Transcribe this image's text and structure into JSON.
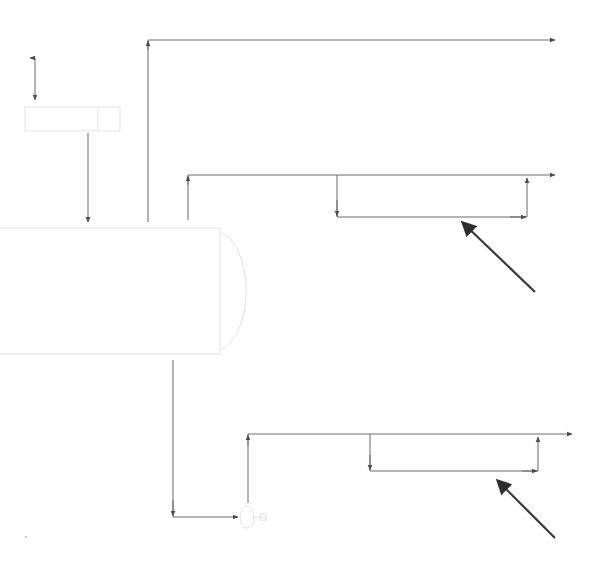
{
  "diagram": {
    "type": "process-flow-diagram",
    "colors": {
      "background": "#ffffff",
      "equipment_outline": "#e2e2e2",
      "stream_line": "#6a6a6a",
      "pointer_arrow": "#3a3a3a"
    },
    "equipment": [
      {
        "id": "exchanger",
        "kind": "heat-exchanger",
        "x": 25,
        "y": 107,
        "w": 95,
        "h": 24,
        "divider_x": 98
      },
      {
        "id": "vessel",
        "kind": "horizontal-drum",
        "x": 0,
        "y": 228,
        "w": 220,
        "h": 126,
        "head_tip_x": 250
      },
      {
        "id": "pump",
        "kind": "pump",
        "cx": 247,
        "cy": 517,
        "rx": 7,
        "ry": 11
      }
    ],
    "streams": [
      {
        "id": "feed-inlet",
        "points": [
          [
            30,
            58
          ],
          [
            35,
            58
          ],
          [
            35,
            100
          ]
        ],
        "arrow": "down"
      },
      {
        "id": "exchanger-to-vessel",
        "points": [
          [
            88,
            133
          ],
          [
            88,
            222
          ]
        ],
        "arrow": "down"
      },
      {
        "id": "overhead-vapor",
        "points": [
          [
            148,
            222
          ],
          [
            148,
            40
          ],
          [
            555,
            40
          ]
        ],
        "arrow": "right"
      },
      {
        "id": "side-draw-upper",
        "points": [
          [
            188,
            220
          ],
          [
            188,
            175
          ],
          [
            555,
            175
          ]
        ],
        "arrow": "right"
      },
      {
        "id": "upper-recycle-loop",
        "points": [
          [
            337,
            175
          ],
          [
            337,
            217
          ],
          [
            527,
            217
          ],
          [
            527,
            178
          ]
        ],
        "arrow": "up"
      },
      {
        "id": "vessel-bottoms",
        "points": [
          [
            173,
            360
          ],
          [
            173,
            517
          ],
          [
            238,
            517
          ]
        ],
        "arrow": "right"
      },
      {
        "id": "pump-discharge",
        "points": [
          [
            248,
            503
          ],
          [
            248,
            434
          ],
          [
            572,
            434
          ]
        ],
        "arrow": "right"
      },
      {
        "id": "lower-recycle-loop",
        "points": [
          [
            370,
            434
          ],
          [
            370,
            471
          ],
          [
            538,
            471
          ],
          [
            538,
            437
          ]
        ],
        "arrow": "up"
      }
    ],
    "pointers": [
      {
        "id": "upper-pointer-arrow",
        "from": [
          535,
          292
        ],
        "to": [
          462,
          222
        ]
      },
      {
        "id": "lower-pointer-arrow",
        "from": [
          555,
          538
        ],
        "to": [
          497,
          480
        ]
      }
    ]
  }
}
